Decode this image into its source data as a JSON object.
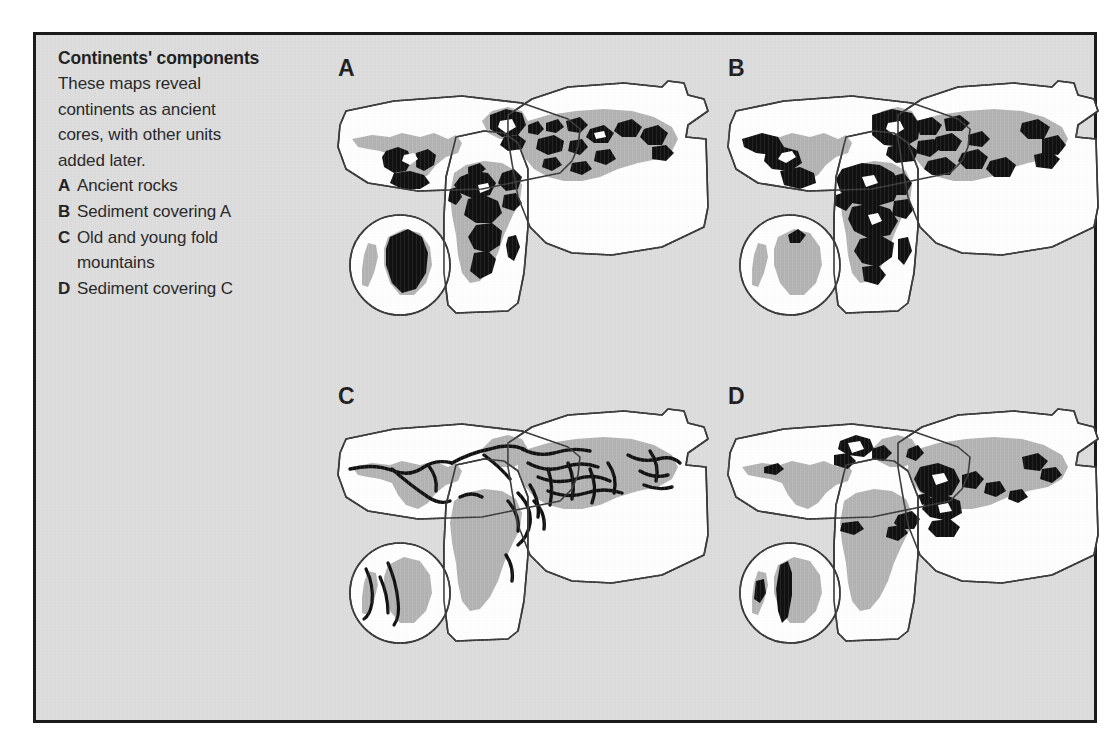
{
  "figure": {
    "caption": {
      "title": "Continents' components",
      "description_lines": [
        "These maps reveal",
        "continents as ancient",
        "cores, with other units",
        "added later."
      ],
      "key": [
        {
          "letter": "A",
          "text": "Ancient rocks",
          "text_cont": ""
        },
        {
          "letter": "B",
          "text": "Sediment covering A",
          "text_cont": ""
        },
        {
          "letter": "C",
          "text": "Old and young fold",
          "text_cont": "mountains"
        },
        {
          "letter": "D",
          "text": "Sediment covering C",
          "text_cont": ""
        }
      ]
    },
    "panels": [
      {
        "label": "A",
        "name": "ancient-rocks",
        "caption": "Ancient rocks"
      },
      {
        "label": "B",
        "name": "sediment-covering-a",
        "caption": "Sediment covering A"
      },
      {
        "label": "C",
        "name": "old-and-young-fold-mountains",
        "caption": "Old and young fold mountains"
      },
      {
        "label": "D",
        "name": "sediment-covering-c",
        "caption": "Sediment covering C"
      }
    ],
    "colors": {
      "background": "#dddddd",
      "frame": "#1b1b1b",
      "landmass_fill": "#ffffff",
      "shelf_gray": "#b4b4b4",
      "highlight_black": "#111111",
      "outline": "#3a3a3a",
      "text": "#262626"
    },
    "map_regions": [
      "North America sheet",
      "Eurasia sheet",
      "Africa and South America sheet",
      "Antarctica inset circle"
    ]
  }
}
